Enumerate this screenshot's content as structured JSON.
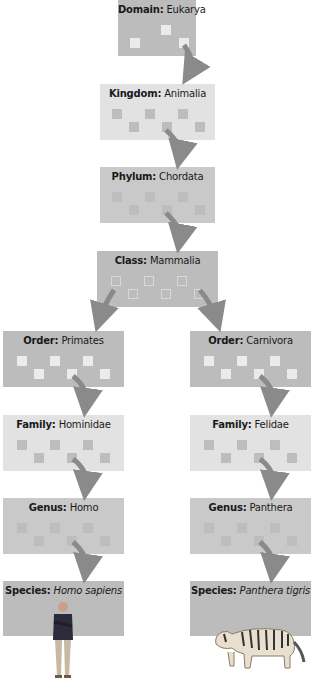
{
  "colors": {
    "box_dark": "#bcbcbc",
    "box_mid": "#c9c9c9",
    "box_light": "#e2e2e2",
    "arrow": "#8a8a8a"
  },
  "levels": {
    "domain": {
      "rank": "Domain:",
      "name": "Eukarya"
    },
    "kingdom": {
      "rank": "Kingdom:",
      "name": "Animalia"
    },
    "phylum": {
      "rank": "Phylum:",
      "name": "Chordata"
    },
    "class": {
      "rank": "Class:",
      "name": "Mammalia"
    },
    "left": {
      "order": {
        "rank": "Order:",
        "name": "Primates"
      },
      "family": {
        "rank": "Family:",
        "name": "Hominidae"
      },
      "genus": {
        "rank": "Genus:",
        "name": "Homo"
      },
      "species": {
        "rank": "Species:",
        "name": "Homo sapiens"
      },
      "image": "human-figure"
    },
    "right": {
      "order": {
        "rank": "Order:",
        "name": "Carnivora"
      },
      "family": {
        "rank": "Family:",
        "name": "Felidae"
      },
      "genus": {
        "rank": "Genus:",
        "name": "Panthera"
      },
      "species": {
        "rank": "Species:",
        "name": "Panthera tigris"
      },
      "image": "tiger-figure"
    }
  }
}
